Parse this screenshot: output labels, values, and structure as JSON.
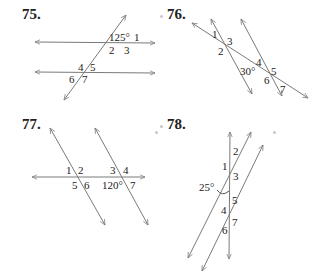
{
  "problems": [
    {
      "number": "75.",
      "labels": {
        "given": "125°",
        "a1": "1",
        "a2": "2",
        "a3": "3",
        "a4": "4",
        "a5": "5",
        "a6": "6",
        "a7": "7"
      }
    },
    {
      "number": "76.",
      "labels": {
        "a1": "1",
        "a2": "2",
        "a3": "3",
        "given": "30°",
        "a4": "4",
        "a5": "5",
        "a6": "6",
        "a7": "7"
      }
    },
    {
      "number": "77.",
      "labels": {
        "a1": "1",
        "a2": "2",
        "a3": "3",
        "a4": "4",
        "a5": "5",
        "a6": "6",
        "given": "120°",
        "a7": "7"
      }
    },
    {
      "number": "78.",
      "labels": {
        "a2": "2",
        "a1": "1",
        "a3": "3",
        "given": "25°",
        "a5": "5",
        "a4": "4",
        "a7": "7",
        "a6": "6"
      }
    }
  ],
  "colors": {
    "line": "#7a7a7a",
    "text": "#222222"
  }
}
